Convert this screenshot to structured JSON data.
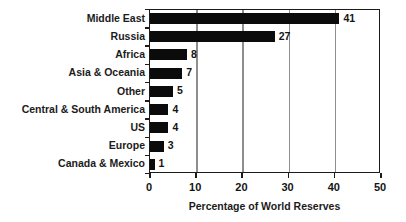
{
  "chart_data": {
    "type": "bar",
    "orientation": "horizontal",
    "title": "",
    "xlabel": "Percentage of World Reserves",
    "ylabel": "",
    "xlim": [
      0,
      50
    ],
    "xticks": [
      0,
      10,
      20,
      30,
      40,
      50
    ],
    "xtick_labels": [
      "0",
      "10",
      "20",
      "30",
      "40",
      "50"
    ],
    "grid": "vertical",
    "legend": "none",
    "categories": [
      "Middle East",
      "Russia",
      "Africa",
      "Asia & Oceania",
      "Other",
      "Central & South America",
      "US",
      "Europe",
      "Canada & Mexico"
    ],
    "values": [
      41,
      27,
      8,
      7,
      5,
      4,
      4,
      3,
      1
    ],
    "value_labels": [
      "41",
      "27",
      "8",
      "7",
      "5",
      "4",
      "4",
      "3",
      "1"
    ],
    "colors": {
      "bar": "#0b0b0b",
      "grid": "#8e8e8e",
      "axis": "#1b1b1b",
      "text": "#141414",
      "background": "#ffffff"
    }
  }
}
